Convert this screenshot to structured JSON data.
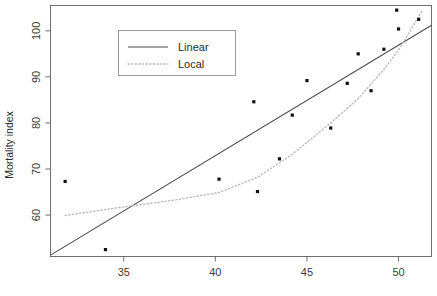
{
  "chart_data": {
    "type": "scatter",
    "title": "",
    "xlabel": "",
    "ylabel": "Mortality index",
    "xlim": [
      31.0,
      51.8
    ],
    "ylim": [
      51.0,
      105.5
    ],
    "xticks": [
      35,
      40,
      45,
      50
    ],
    "xticklabels": [
      "35",
      "40",
      "45",
      "50"
    ],
    "yticks": [
      60,
      70,
      80,
      90,
      100
    ],
    "yticklabels": [
      "60",
      "70",
      "80",
      "90",
      "100"
    ],
    "grid": false,
    "legend_position": "top-left",
    "points": [
      {
        "x": 31.8,
        "y": 67.3
      },
      {
        "x": 34.0,
        "y": 52.5
      },
      {
        "x": 40.2,
        "y": 67.8
      },
      {
        "x": 42.1,
        "y": 84.6
      },
      {
        "x": 42.3,
        "y": 65.1
      },
      {
        "x": 43.5,
        "y": 72.2
      },
      {
        "x": 44.2,
        "y": 81.7
      },
      {
        "x": 45.0,
        "y": 89.2
      },
      {
        "x": 46.3,
        "y": 78.9
      },
      {
        "x": 47.2,
        "y": 88.6
      },
      {
        "x": 47.8,
        "y": 95.0
      },
      {
        "x": 48.5,
        "y": 87.0
      },
      {
        "x": 49.2,
        "y": 96.0
      },
      {
        "x": 49.9,
        "y": 104.5
      },
      {
        "x": 50.0,
        "y": 100.4
      },
      {
        "x": 51.1,
        "y": 102.5
      }
    ],
    "series": [
      {
        "name": "Linear",
        "style": "solid",
        "color": "#4a4a4a",
        "x": [
          31.0,
          51.8
        ],
        "y": [
          51.3,
          101.2
        ]
      },
      {
        "name": "Local",
        "style": "dotted",
        "color": "#b9b9b9",
        "x": [
          31.8,
          34.0,
          36.0,
          38.0,
          40.2,
          42.3,
          44.2,
          46.3,
          47.8,
          49.2,
          50.0,
          51.3
        ],
        "y": [
          59.9,
          61.2,
          62.3,
          63.4,
          64.9,
          68.2,
          73.2,
          80.0,
          85.3,
          91.6,
          95.8,
          104.4
        ]
      }
    ],
    "legend": [
      {
        "label": "Linear",
        "style": "solid"
      },
      {
        "label": "Local",
        "style": "dotted"
      }
    ]
  },
  "axis": {
    "y_title": "Mortality index"
  }
}
